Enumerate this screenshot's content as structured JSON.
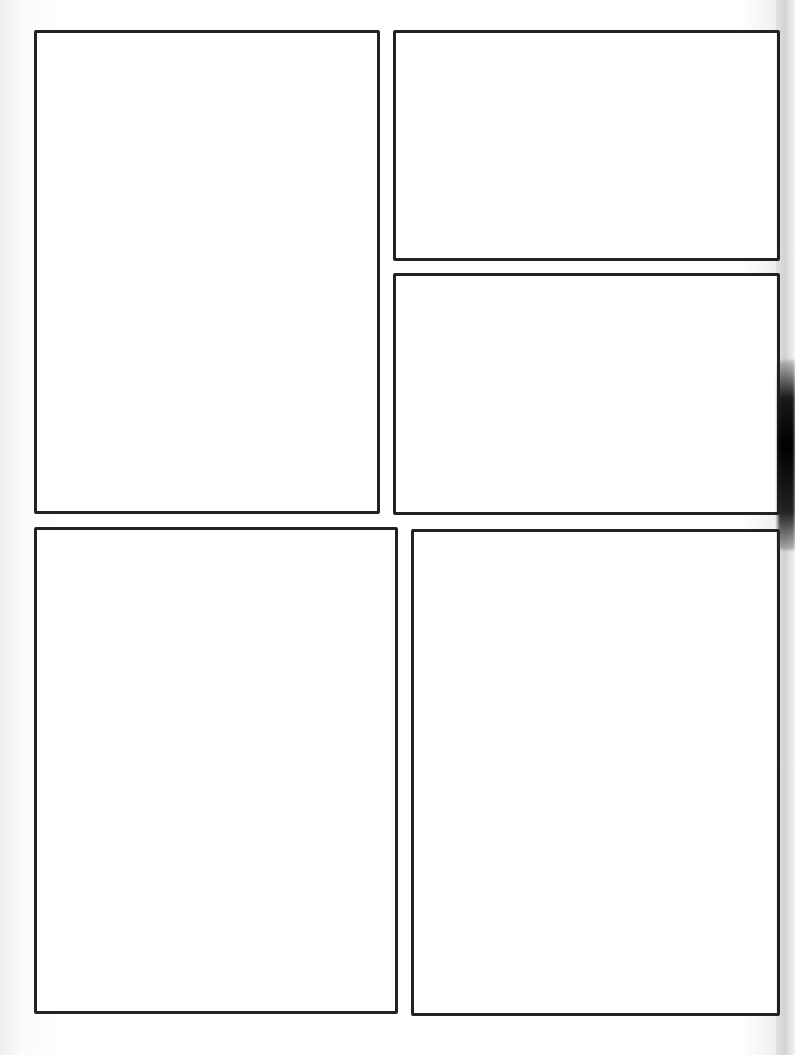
{
  "page": {
    "type": "comic-panel-template",
    "background": "#ffffff",
    "border_color": "#222222"
  },
  "panels": [
    {
      "id": "panel-1",
      "x": 34,
      "y": 30,
      "w": 346,
      "h": 484
    },
    {
      "id": "panel-2",
      "x": 393,
      "y": 30,
      "w": 387,
      "h": 231
    },
    {
      "id": "panel-3",
      "x": 393,
      "y": 273,
      "w": 387,
      "h": 242
    },
    {
      "id": "panel-4",
      "x": 34,
      "y": 527,
      "w": 364,
      "h": 487
    },
    {
      "id": "panel-5",
      "x": 411,
      "y": 529,
      "w": 369,
      "h": 487
    }
  ]
}
